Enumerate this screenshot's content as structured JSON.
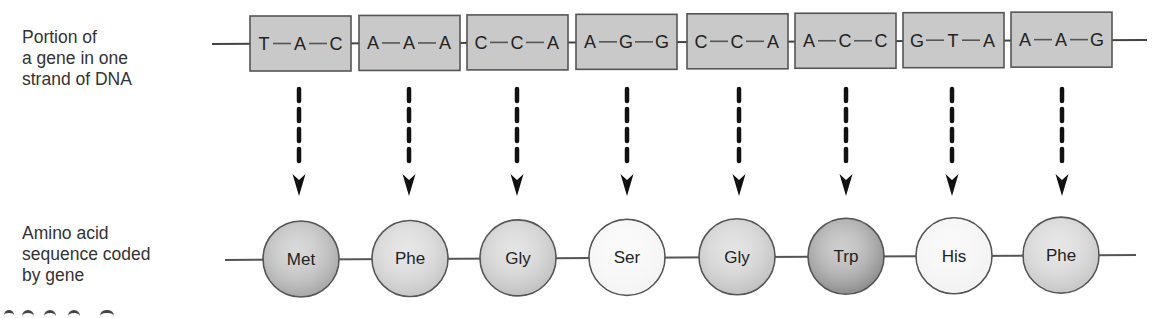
{
  "labels": {
    "dna": [
      "Portion of",
      "a gene in one",
      "strand of DNA"
    ],
    "amino": [
      "Amino acid",
      "sequence coded",
      "by gene"
    ]
  },
  "colors": {
    "box_fill": "#c9c9c9",
    "box_stroke": "#555555",
    "strand_line": "#444444",
    "arrow": "#111111"
  },
  "codons": [
    {
      "bases": [
        "T",
        "A",
        "C"
      ],
      "amino_acid": "Met",
      "shade": "#a9a9a9"
    },
    {
      "bases": [
        "A",
        "A",
        "A"
      ],
      "amino_acid": "Phe",
      "shade": "#c8c8c8"
    },
    {
      "bases": [
        "C",
        "C",
        "A"
      ],
      "amino_acid": "Gly",
      "shade": "#c2c2c2"
    },
    {
      "bases": [
        "A",
        "G",
        "G"
      ],
      "amino_acid": "Ser",
      "shade": "#f4f4f4"
    },
    {
      "bases": [
        "C",
        "C",
        "A"
      ],
      "amino_acid": "Gly",
      "shade": "#c2c2c2"
    },
    {
      "bases": [
        "A",
        "C",
        "C"
      ],
      "amino_acid": "Trp",
      "shade": "#8f8f8f"
    },
    {
      "bases": [
        "G",
        "T",
        "A"
      ],
      "amino_acid": "His",
      "shade": "#f2f2f2"
    },
    {
      "bases": [
        "A",
        "A",
        "G"
      ],
      "amino_acid": "Phe",
      "shade": "#c8c8c8"
    }
  ]
}
